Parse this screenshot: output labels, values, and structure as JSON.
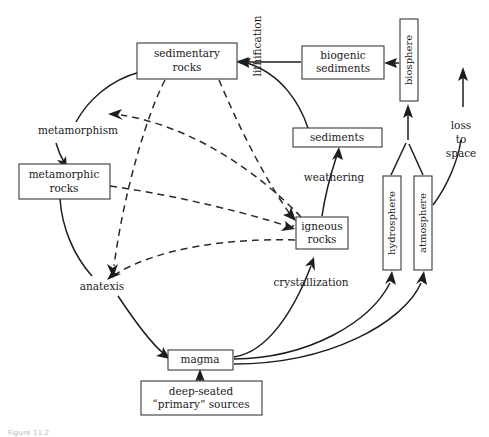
{
  "diagram": {
    "caption": "Figure 11.2",
    "accent_color": "#1d1d1d",
    "background_color": "#ffffff",
    "boxes": [
      {
        "id": "sedimentary-rocks",
        "label": "sedimentary rocks",
        "line1": "sedimentary",
        "line2": "rocks",
        "orientation": "horizontal"
      },
      {
        "id": "biogenic-sediments",
        "label": "biogenic sediments",
        "line1": "biogenic",
        "line2": "sediments",
        "orientation": "horizontal"
      },
      {
        "id": "biosphere",
        "label": "biosphere",
        "line1": "biosphere",
        "line2": "",
        "orientation": "vertical"
      },
      {
        "id": "sediments",
        "label": "sediments",
        "line1": "sediments",
        "line2": "",
        "orientation": "horizontal"
      },
      {
        "id": "metamorphic-rocks",
        "label": "metamorphic rocks",
        "line1": "metamorphic",
        "line2": "rocks",
        "orientation": "horizontal"
      },
      {
        "id": "igneous-rocks",
        "label": "igneous rocks",
        "line1": "igneous",
        "line2": "rocks",
        "orientation": "horizontal"
      },
      {
        "id": "hydrosphere",
        "label": "hydrosphere",
        "line1": "hydrosphere",
        "line2": "",
        "orientation": "vertical"
      },
      {
        "id": "atmosphere",
        "label": "atmosphere",
        "line1": "atmosphere",
        "line2": "",
        "orientation": "vertical"
      },
      {
        "id": "magma",
        "label": "magma",
        "line1": "magma",
        "line2": "",
        "orientation": "horizontal"
      },
      {
        "id": "deep-seated-sources",
        "label": "deep-seated “primary” sources",
        "line1": "deep-seated",
        "line2": "“primary” sources",
        "orientation": "horizontal"
      }
    ],
    "process_labels": [
      {
        "id": "lithification",
        "text": "lithification",
        "orientation": "vertical"
      },
      {
        "id": "metamorphism",
        "text": "metamorphism",
        "orientation": "horizontal"
      },
      {
        "id": "weathering",
        "text": "weathering",
        "orientation": "horizontal"
      },
      {
        "id": "anatexis",
        "text": "anatexis",
        "orientation": "horizontal"
      },
      {
        "id": "crystallization",
        "text": "crystallization",
        "orientation": "horizontal"
      }
    ],
    "loss_label": {
      "id": "loss-to-space",
      "line1": "loss",
      "line2": "to",
      "line3": "space"
    },
    "flows": [
      {
        "id": "biogenic-to-sedimentary",
        "style": "solid",
        "from": "biogenic-sediments",
        "to": "sedimentary-rocks",
        "via": "lithification"
      },
      {
        "id": "sediments-to-sedimentary",
        "style": "solid",
        "from": "sediments",
        "to": "sedimentary-rocks",
        "via": "lithification"
      },
      {
        "id": "biosphere-to-biogenic",
        "style": "solid",
        "from": "biosphere",
        "to": "biogenic-sediments",
        "via": ""
      },
      {
        "id": "igneous-to-sediments",
        "style": "solid",
        "from": "igneous-rocks",
        "to": "sediments",
        "via": "weathering"
      },
      {
        "id": "sedimentary-to-metamorphic",
        "style": "solid",
        "from": "sedimentary-rocks",
        "to": "metamorphic-rocks",
        "via": "metamorphism"
      },
      {
        "id": "metamorphic-to-anatexis",
        "style": "solid",
        "from": "metamorphic-rocks",
        "to": "anatexis",
        "via": "anatexis"
      },
      {
        "id": "anatexis-to-magma",
        "style": "solid",
        "from": "anatexis",
        "to": "magma",
        "via": ""
      },
      {
        "id": "deep-sources-to-magma",
        "style": "solid",
        "from": "deep-seated-sources",
        "to": "magma",
        "via": ""
      },
      {
        "id": "magma-to-igneous",
        "style": "solid",
        "from": "magma",
        "to": "igneous-rocks",
        "via": "crystallization"
      },
      {
        "id": "magma-to-hydrosphere",
        "style": "solid",
        "from": "magma",
        "to": "hydrosphere",
        "via": ""
      },
      {
        "id": "magma-to-atmosphere",
        "style": "solid",
        "from": "magma",
        "to": "atmosphere",
        "via": ""
      },
      {
        "id": "hydrosphere-to-biosphere",
        "style": "solid",
        "from": "hydrosphere",
        "to": "biosphere",
        "via": ""
      },
      {
        "id": "atmosphere-to-biosphere",
        "style": "solid",
        "from": "atmosphere",
        "to": "biosphere",
        "via": ""
      },
      {
        "id": "atmosphere-to-space",
        "style": "solid",
        "from": "atmosphere",
        "to": "loss-to-space",
        "via": "loss to space"
      },
      {
        "id": "sedimentary-to-igneous-d",
        "style": "dashed",
        "from": "sedimentary-rocks",
        "to": "igneous-rocks",
        "via": ""
      },
      {
        "id": "sedimentary-to-anatexis-d",
        "style": "dashed",
        "from": "sedimentary-rocks",
        "to": "anatexis",
        "via": ""
      },
      {
        "id": "metamorphic-to-igneous-d",
        "style": "dashed",
        "from": "metamorphic-rocks",
        "to": "igneous-rocks",
        "via": ""
      },
      {
        "id": "igneous-to-metamorphic-d",
        "style": "dashed",
        "from": "igneous-rocks",
        "to": "metamorphism",
        "via": ""
      },
      {
        "id": "igneous-to-anatexis-d",
        "style": "dashed",
        "from": "igneous-rocks",
        "to": "anatexis",
        "via": ""
      }
    ]
  }
}
